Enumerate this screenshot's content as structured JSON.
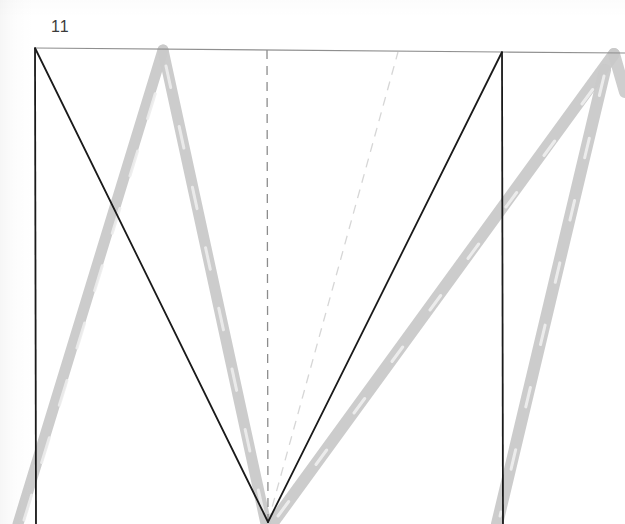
{
  "figure": {
    "label": "11",
    "caption_label_position": "top-left",
    "background_color": "#ffffff",
    "media": "scanned-line-drawing"
  },
  "colors": {
    "ink_black": "#1a1a1a",
    "frame_gray": "#7a7a7a",
    "trace_gray": "#c9c9c9",
    "trace_gray_light": "#dcdcdc",
    "dash_gray": "#8c8c8c",
    "dash_gray_light": "#d8d8d8",
    "paper": "#ffffff"
  },
  "chart_data": {
    "type": "line",
    "title": "11",
    "xlabel": "",
    "ylabel": "",
    "grid": false,
    "legend": null,
    "xlim": [
      0,
      625
    ],
    "ylim": [
      524,
      0
    ],
    "annotations": [
      {
        "name": "figure-number",
        "text": "11",
        "x": 51,
        "y": 30
      }
    ],
    "series": [
      {
        "name": "frame-top-rule",
        "style": "solid",
        "color": "#8f8f8f",
        "width": 1.2,
        "points": [
          [
            35,
            48
          ],
          [
            502,
            52
          ],
          [
            625,
            53
          ]
        ]
      },
      {
        "name": "frame-left-edge",
        "style": "solid",
        "color": "#1a1a1a",
        "width": 1.8,
        "points": [
          [
            35,
            48
          ],
          [
            36,
            524
          ]
        ]
      },
      {
        "name": "frame-right-edge",
        "style": "solid",
        "color": "#1a1a1a",
        "width": 1.8,
        "points": [
          [
            502,
            52
          ],
          [
            503,
            524
          ]
        ]
      },
      {
        "name": "black-v-left-leg",
        "style": "solid",
        "color": "#1a1a1a",
        "width": 1.8,
        "points": [
          [
            35,
            48
          ],
          [
            268,
            522
          ]
        ]
      },
      {
        "name": "black-v-right-leg",
        "style": "solid",
        "color": "#1a1a1a",
        "width": 1.8,
        "points": [
          [
            268,
            522
          ],
          [
            502,
            52
          ]
        ]
      },
      {
        "name": "gray-trace-left-rise",
        "style": "solid",
        "color": "#c9c9c9",
        "width": 11,
        "points": [
          [
            18,
            524
          ],
          [
            163,
            50
          ]
        ]
      },
      {
        "name": "gray-trace-center-fall",
        "style": "solid",
        "color": "#c9c9c9",
        "width": 11,
        "points": [
          [
            163,
            50
          ],
          [
            266,
            524
          ]
        ]
      },
      {
        "name": "gray-trace-center-rise",
        "style": "solid",
        "color": "#c9c9c9",
        "width": 12,
        "points": [
          [
            272,
            524
          ],
          [
            614,
            54
          ]
        ]
      },
      {
        "name": "gray-trace-right-fall",
        "style": "solid",
        "color": "#c9c9c9",
        "width": 12,
        "points": [
          [
            614,
            54
          ],
          [
            625,
            90
          ]
        ]
      },
      {
        "name": "gray-trace-right-descent",
        "style": "solid",
        "color": "#c9c9c9",
        "width": 12,
        "points": [
          [
            605,
            70
          ],
          [
            497,
            524
          ]
        ]
      },
      {
        "name": "dashed-center-vertical",
        "style": "dashed",
        "color": "#8c8c8c",
        "width": 1.3,
        "points": [
          [
            267,
            50
          ],
          [
            268,
            522
          ]
        ]
      },
      {
        "name": "dashed-diagonal-light",
        "style": "dashed",
        "color": "#d6d6d6",
        "width": 1.3,
        "points": [
          [
            268,
            522
          ],
          [
            398,
            52
          ]
        ]
      }
    ]
  }
}
